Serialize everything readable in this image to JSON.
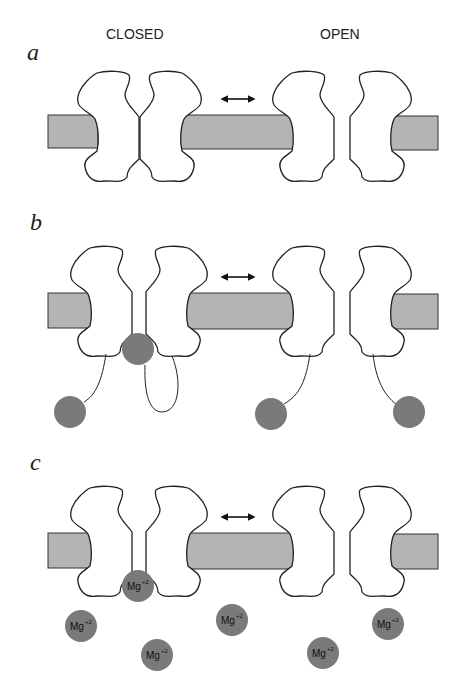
{
  "headers": {
    "closed": "CLOSED",
    "open": "OPEN"
  },
  "panels": [
    {
      "label": "a",
      "description": "Channel gating: closed vs open conformation"
    },
    {
      "label": "b",
      "description": "Ball-and-chain inactivation: ball plugs pore in closed state"
    },
    {
      "label": "c",
      "description": "Mg2+ block: Mg ion occludes pore in closed state"
    }
  ],
  "ion": {
    "symbol": "Mg",
    "charge": "+2"
  },
  "transition_symbol": "double-headed-arrow",
  "colors": {
    "membrane": "#b4b4b4",
    "ball": "#7a7a7a",
    "outline": "#222222"
  }
}
